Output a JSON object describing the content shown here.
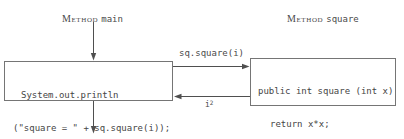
{
  "headers": {
    "main": {
      "prefix": "Method",
      "name": "main"
    },
    "square": {
      "prefix": "Method",
      "name": "square"
    }
  },
  "boxes": {
    "main": {
      "lines": {
        "0": "System.out.println",
        "1": "(\"square = \" + sq.square(i));"
      }
    },
    "square": {
      "lines": {
        "0": "public int square (int x)",
        "1": "return x*x;",
        "2": "}"
      }
    }
  },
  "arrows": {
    "call_label": "sq.square(i)",
    "return_label_base": "i",
    "return_label_sup": "2"
  },
  "colors": {
    "line": "#4f4f4f",
    "border": "#757575",
    "text": "#454545",
    "background": "#ffffff"
  }
}
